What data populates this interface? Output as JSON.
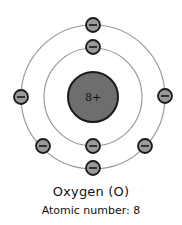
{
  "diagram": {
    "type": "bohr-atom-model",
    "nucleus": {
      "label": "8+",
      "fill": "#6e6e6e",
      "stroke": "#1a1a1a"
    },
    "shells": [
      {
        "name": "inner-shell",
        "radius": 49,
        "electron_count": 2
      },
      {
        "name": "outer-shell",
        "radius": 72,
        "electron_count": 6
      }
    ],
    "electron": {
      "symbol": "−",
      "fill": "#9a9a9a",
      "stroke": "#1a1a1a"
    },
    "orbit_color": "#9a9a9a"
  },
  "caption": {
    "title": "Oxygen (O)",
    "subtitle": "Atomic number: 8"
  }
}
